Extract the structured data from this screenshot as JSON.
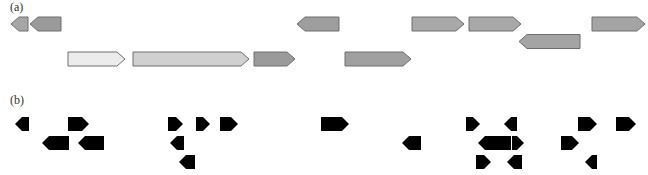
{
  "panels": {
    "a": {
      "label": "(a)",
      "genes": [
        {
          "dir": "left",
          "x0": 11,
          "x1": 28,
          "row": 0,
          "fill": "#a6a6a6"
        },
        {
          "dir": "left",
          "x0": 30,
          "x1": 61,
          "row": 0,
          "fill": "#9a9a9a"
        },
        {
          "dir": "right",
          "x0": 68,
          "x1": 125,
          "row": 1,
          "fill": "#ececec"
        },
        {
          "dir": "right",
          "x0": 133,
          "x1": 249,
          "row": 1,
          "fill": "#d0d0d0"
        },
        {
          "dir": "right",
          "x0": 254,
          "x1": 295,
          "row": 1,
          "fill": "#9a9a9a"
        },
        {
          "dir": "left",
          "x0": 297,
          "x1": 339,
          "row": 0,
          "fill": "#9e9e9e"
        },
        {
          "dir": "right",
          "x0": 345,
          "x1": 411,
          "row": 1,
          "fill": "#a0a0a0"
        },
        {
          "dir": "right",
          "x0": 412,
          "x1": 464,
          "row": 0,
          "fill": "#a8a8a8"
        },
        {
          "dir": "right",
          "x0": 469,
          "x1": 521,
          "row": 0,
          "fill": "#a8a8a8"
        },
        {
          "dir": "left",
          "x0": 519,
          "x1": 580,
          "row": 0.5,
          "fill": "#a4a4a4"
        },
        {
          "dir": "right",
          "x0": 592,
          "x1": 645,
          "row": 0,
          "fill": "#a4a4a4"
        }
      ]
    },
    "b": {
      "label": "(b)",
      "genes": [
        {
          "dir": "left",
          "x0": 15,
          "x1": 29,
          "row": 0
        },
        {
          "dir": "right",
          "x0": 68,
          "x1": 89,
          "row": 0
        },
        {
          "dir": "left",
          "x0": 42,
          "x1": 69,
          "row": 1
        },
        {
          "dir": "left",
          "x0": 78,
          "x1": 104,
          "row": 1
        },
        {
          "dir": "right",
          "x0": 168,
          "x1": 183,
          "row": 0
        },
        {
          "dir": "right",
          "x0": 196,
          "x1": 210,
          "row": 0
        },
        {
          "dir": "right",
          "x0": 220,
          "x1": 238,
          "row": 0
        },
        {
          "dir": "left",
          "x0": 170,
          "x1": 184,
          "row": 1
        },
        {
          "dir": "left",
          "x0": 179,
          "x1": 195,
          "row": 2
        },
        {
          "dir": "right",
          "x0": 321,
          "x1": 349,
          "row": 0
        },
        {
          "dir": "left",
          "x0": 402,
          "x1": 421,
          "row": 1
        },
        {
          "dir": "right",
          "x0": 466,
          "x1": 480,
          "row": 0
        },
        {
          "dir": "left",
          "x0": 504,
          "x1": 517,
          "row": 0
        },
        {
          "dir": "left",
          "x0": 478,
          "x1": 511,
          "row": 1
        },
        {
          "dir": "right",
          "x0": 512,
          "x1": 524,
          "row": 1
        },
        {
          "dir": "right",
          "x0": 476,
          "x1": 491,
          "row": 2
        },
        {
          "dir": "left",
          "x0": 507,
          "x1": 522,
          "row": 2
        },
        {
          "dir": "right",
          "x0": 578,
          "x1": 597,
          "row": 0
        },
        {
          "dir": "right",
          "x0": 616,
          "x1": 636,
          "row": 0
        },
        {
          "dir": "right",
          "x0": 561,
          "x1": 579,
          "row": 1
        },
        {
          "dir": "left",
          "x0": 585,
          "x1": 597,
          "row": 2
        }
      ]
    }
  }
}
